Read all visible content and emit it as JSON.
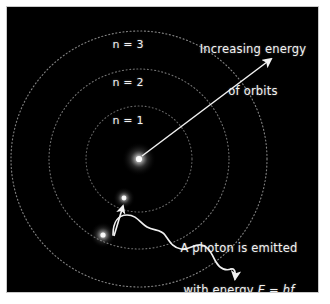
{
  "figure": {
    "background_color": "#000000",
    "border_color": "#c9c9c9",
    "ink_color": "#f2f2f2"
  },
  "orbits": [
    {
      "label": "n = 1",
      "level": 1,
      "radius_px": 53
    },
    {
      "label": "n = 2",
      "level": 2,
      "radius_px": 90
    },
    {
      "label": "n = 3",
      "level": 3,
      "radius_px": 128
    }
  ],
  "nucleus": {
    "name": "nucleus",
    "x": 132,
    "y": 152
  },
  "electrons": [
    {
      "name": "electron-excited",
      "x": 117,
      "y": 191,
      "orbit_level": 2
    },
    {
      "name": "electron-ground",
      "x": 96,
      "y": 228,
      "orbit_level": 3
    }
  ],
  "annotations": {
    "energy_arrow": {
      "line_1": "Increasing energy",
      "line_2": "of orbits",
      "text": "Increasing energy of orbits"
    },
    "photon": {
      "line_1": "A photon is emitted",
      "line_2_prefix": "with energy ",
      "line_2_symbol_e": "E",
      "line_2_equals": " = ",
      "line_2_symbol_hf": "hf",
      "text": "A photon is emitted with energy E = hf"
    }
  }
}
